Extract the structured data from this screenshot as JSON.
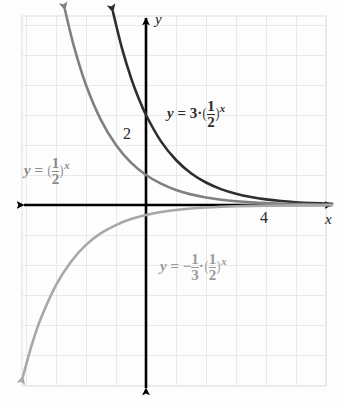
{
  "figure": {
    "background_color": "#fdfdfd",
    "grid_color": "#e9e9e9",
    "grid_border_color": "#dedede",
    "axis_color": "#000000"
  },
  "axes": {
    "x_label": "x",
    "y_label": "y",
    "x_ticks": [
      {
        "label": "4",
        "value": 4
      }
    ],
    "y_ticks": [
      {
        "label": "2",
        "value": 2
      }
    ],
    "origin_px": {
      "x": 146,
      "y": 205
    },
    "unit_px": 30,
    "xlim": [
      -4.1,
      6.5
    ],
    "ylim": [
      -6.2,
      6.4
    ]
  },
  "labels": {
    "curve_dark": {
      "lead": "y",
      "equals": "=",
      "coefficient": "3",
      "dot": "·",
      "base_num": "1",
      "base_den": "2",
      "exponent": "x",
      "plain_text": "y = 3 · (1/2)^x",
      "color": "#2e2e2e"
    },
    "curve_medium": {
      "lead": "y",
      "equals": "=",
      "base_num": "1",
      "base_den": "2",
      "exponent": "x",
      "plain_text": "y = (1/2)^x",
      "color": "#8a8a8a"
    },
    "curve_light": {
      "lead": "y",
      "equals": "=",
      "minus": "−",
      "coef_num": "1",
      "coef_den": "3",
      "dot": "·",
      "base_num": "1",
      "base_den": "2",
      "exponent": "x",
      "plain_text": "y = − 1/3 · (1/2)^x",
      "color": "#9a9a9a"
    }
  },
  "chart_data": {
    "type": "line",
    "title": "",
    "xlabel": "x",
    "ylabel": "y",
    "xlim": [
      -4.1,
      6.5
    ],
    "ylim": [
      -6.2,
      6.4
    ],
    "grid": true,
    "grid_step": 1,
    "legend": "inline-annotations",
    "series": [
      {
        "name": "y = 3 · (1/2)^x",
        "color": "#2e2e2e",
        "width_px": 2.6,
        "arrow_start": true,
        "arrow_end": false,
        "formula": {
          "a": 3,
          "b": 0.5
        },
        "y_intercept": 3,
        "x": [
          -1.1,
          -0.8,
          -0.5,
          -0.25,
          0,
          0.5,
          1,
          1.5,
          2,
          2.5,
          3,
          3.5,
          4,
          4.5,
          5,
          5.5,
          6.2
        ],
        "y": [
          6.43,
          5.22,
          4.24,
          3.57,
          3,
          2.12,
          1.5,
          1.06,
          0.75,
          0.53,
          0.375,
          0.265,
          0.1875,
          0.133,
          0.094,
          0.066,
          0.041
        ]
      },
      {
        "name": "y = (1/2)^x",
        "color": "#808080",
        "width_px": 2.6,
        "arrow_start": true,
        "arrow_end": false,
        "formula": {
          "a": 1,
          "b": 0.5
        },
        "y_intercept": 1,
        "x": [
          -2.7,
          -2.4,
          -2,
          -1.5,
          -1,
          -0.5,
          0,
          0.5,
          1,
          1.5,
          2,
          2.5,
          3,
          3.5,
          4,
          4.5,
          5,
          5.5,
          6.2
        ],
        "y": [
          6.5,
          5.28,
          4,
          2.83,
          2,
          1.41,
          1,
          0.71,
          0.5,
          0.354,
          0.25,
          0.177,
          0.125,
          0.088,
          0.0625,
          0.044,
          0.031,
          0.022,
          0.013
        ]
      },
      {
        "name": "y = − 1/3 · (1/2)^x",
        "color": "#a8a8a8",
        "width_px": 2.6,
        "arrow_start": true,
        "arrow_end": false,
        "formula": {
          "a": -0.3333,
          "b": 0.5
        },
        "y_intercept": -0.333,
        "x": [
          -4.1,
          -3.8,
          -3.5,
          -3,
          -2.5,
          -2,
          -1.5,
          -1,
          -0.5,
          0,
          0.5,
          1,
          1.5,
          2,
          2.5,
          3,
          3.5,
          4,
          4.5,
          5,
          5.5,
          6.2
        ],
        "y": [
          -5.71,
          -4.64,
          -3.77,
          -2.67,
          -1.89,
          -1.33,
          -0.94,
          -0.67,
          -0.47,
          -0.333,
          -0.236,
          -0.167,
          -0.118,
          -0.083,
          -0.059,
          -0.042,
          -0.029,
          -0.021,
          -0.015,
          -0.0104,
          -0.0074,
          -0.0045
        ]
      }
    ]
  }
}
